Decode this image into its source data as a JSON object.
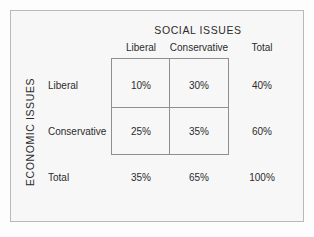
{
  "figure": {
    "column_group_title": "SOCIAL ISSUES",
    "row_group_title": "ECONOMIC ISSUES",
    "background_color": "#f7f7f7",
    "frame_color": "#b9b9b9",
    "grid_color": "#8f8f8f",
    "text_color": "#2b2b2b"
  },
  "chart_data": {
    "type": "table",
    "title": "",
    "xlabel": "SOCIAL ISSUES",
    "ylabel": "ECONOMIC ISSUES",
    "columns": [
      "Liberal",
      "Conservative",
      "Total"
    ],
    "rows": [
      "Liberal",
      "Conservative",
      "Total"
    ],
    "cells": [
      [
        "10%",
        "30%",
        "40%"
      ],
      [
        "25%",
        "35%",
        "60%"
      ],
      [
        "35%",
        "65%",
        "100%"
      ]
    ],
    "values": [
      [
        10,
        30,
        40
      ],
      [
        25,
        35,
        60
      ],
      [
        35,
        65,
        100
      ]
    ],
    "units": "percent",
    "body_rows": [
      "Liberal",
      "Conservative"
    ],
    "body_columns": [
      "Liberal",
      "Conservative"
    ],
    "margin_row_label": "Total",
    "margin_column_label": "Total",
    "grid": true,
    "legend": "none"
  }
}
